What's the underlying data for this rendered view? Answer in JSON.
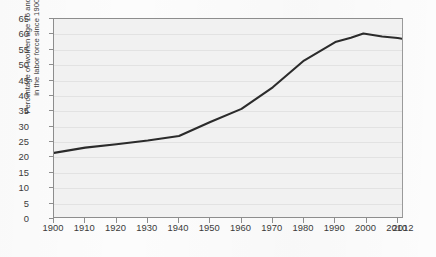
{
  "chart_data": {
    "type": "line",
    "title": "",
    "xlabel": "",
    "ylabel": "Percentage of women age 16 and over in the labor force since 1900",
    "ylabel_lines": [
      "Percentage of women age 16 and over",
      "in the labor force since 1900"
    ],
    "xlim": [
      1900,
      2012
    ],
    "ylim": [
      0,
      65
    ],
    "ytick_step": 5,
    "yticks": [
      0,
      5,
      10,
      15,
      20,
      25,
      30,
      35,
      40,
      45,
      50,
      55,
      60,
      65
    ],
    "xticks": [
      1900,
      1910,
      1920,
      1930,
      1940,
      1950,
      1960,
      1970,
      1980,
      1990,
      2000,
      2010,
      2012
    ],
    "xtick_labels": [
      "1900",
      "1910",
      "1920",
      "1930",
      "1940",
      "1950",
      "1960",
      "1970",
      "1980",
      "1990",
      "2000",
      "2010",
      "2012"
    ],
    "grid": true,
    "grid_axis": "y",
    "legend": false,
    "series": [
      {
        "name": "Percentage of women age 16 and over in the labor force",
        "x": [
          1900,
          1910,
          1920,
          1930,
          1940,
          1950,
          1960,
          1970,
          1980,
          1990,
          1995,
          1999,
          2005,
          2010,
          2012
        ],
        "values": [
          21.5,
          23.2,
          24.3,
          25.5,
          27.0,
          31.5,
          35.8,
          42.8,
          51.5,
          57.5,
          58.9,
          60.3,
          59.3,
          58.8,
          58.5
        ]
      }
    ],
    "colors": {
      "line": "#2b2b2b",
      "plot_background": "#f1f1f1",
      "frame": "#8d8d8d",
      "gridline": "#e2e2e2",
      "page_background": "#fcfcfc",
      "text": "#3a3a3a"
    }
  }
}
